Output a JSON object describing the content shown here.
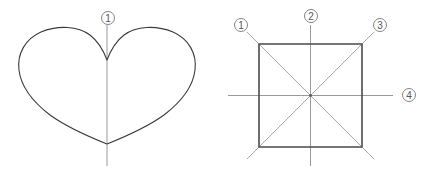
{
  "figure": {
    "canvas": {
      "width": 431,
      "height": 172,
      "background": "#ffffff"
    },
    "colors": {
      "shape_stroke": "#3a3a3a",
      "square_stroke": "#4a4a4a",
      "axis_stroke": "#9a9a9a",
      "diagonal_stroke": "#a8a8a8",
      "label_stroke": "#777777",
      "label_text": "#555555",
      "background": "#ffffff"
    },
    "panels": [
      {
        "id": "heart-panel",
        "name": "heart-figure",
        "shape": "heart",
        "shape_label": "heart outline",
        "bounds": {
          "x": 19,
          "y": 27,
          "width": 177,
          "height": 118
        },
        "cleft_point": {
          "x": 107,
          "y": 60
        },
        "bottom_point": {
          "x": 107,
          "y": 144
        },
        "axes": [
          {
            "id": "heart-axis-1",
            "label": "①",
            "label_number": 1,
            "orientation": "vertical",
            "x1": 107,
            "y1": 25,
            "x2": 107,
            "y2": 166,
            "label_pos": {
              "x": 108,
              "y": 18
            }
          }
        ]
      },
      {
        "id": "square-panel",
        "name": "square-figure",
        "shape": "square",
        "shape_label": "square outline",
        "bounds": {
          "x": 259,
          "y": 44,
          "width": 103,
          "height": 103
        },
        "center": {
          "x": 310.5,
          "y": 95.5
        },
        "axes": [
          {
            "id": "square-axis-1",
            "label": "①",
            "label_number": 1,
            "orientation": "diagonal-down-right",
            "x1": 247,
            "y1": 32,
            "x2": 374,
            "y2": 159,
            "label_pos": {
              "x": 241,
              "y": 25
            }
          },
          {
            "id": "square-axis-2",
            "label": "②",
            "label_number": 2,
            "orientation": "vertical",
            "x1": 310.5,
            "y1": 25,
            "x2": 310.5,
            "y2": 166,
            "label_pos": {
              "x": 311,
              "y": 16
            }
          },
          {
            "id": "square-axis-3",
            "label": "③",
            "label_number": 3,
            "orientation": "diagonal-up-right",
            "x1": 247,
            "y1": 159,
            "x2": 374,
            "y2": 32,
            "label_pos": {
              "x": 380,
              "y": 25
            }
          },
          {
            "id": "square-axis-4",
            "label": "④",
            "label_number": 4,
            "orientation": "horizontal",
            "x1": 228,
            "y1": 95.5,
            "x2": 393,
            "y2": 95.5,
            "label_pos": {
              "x": 409,
              "y": 95
            }
          }
        ]
      }
    ]
  }
}
